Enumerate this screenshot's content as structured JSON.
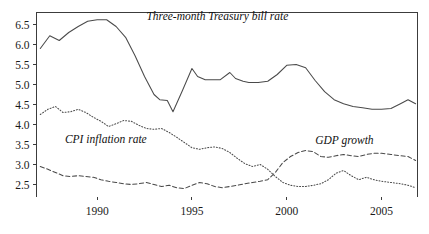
{
  "chart_data": {
    "type": "line",
    "title": "",
    "xlabel": "",
    "ylabel": "",
    "xlim": [
      1986.8,
      2006.9
    ],
    "ylim": [
      2.2,
      6.8
    ],
    "grid": false,
    "legend_position": "inline-annotations",
    "yticks": [
      "2.5",
      "3.0",
      "3.5",
      "4.0",
      "4.5",
      "5.0",
      "5.5",
      "6.0",
      "6.5"
    ],
    "ytick_values": [
      2.5,
      3.0,
      3.5,
      4.0,
      4.5,
      5.0,
      5.5,
      6.0,
      6.5
    ],
    "xticks": [
      "1990",
      "1995",
      "2000",
      "2005"
    ],
    "xtick_values": [
      1990,
      1995,
      2000,
      2005
    ],
    "series": [
      {
        "name": "Three-month Treasury bill rate",
        "style": "solid",
        "label_x": 1992.6,
        "label_y": 6.62,
        "x": [
          1987.0,
          1987.5,
          1988.0,
          1988.5,
          1989.0,
          1989.5,
          1990.0,
          1990.5,
          1991.0,
          1991.5,
          1992.0,
          1992.5,
          1993.0,
          1993.3,
          1993.7,
          1994.0,
          1994.5,
          1995.0,
          1995.3,
          1995.7,
          1996.0,
          1996.5,
          1997.0,
          1997.3,
          1997.7,
          1998.0,
          1998.5,
          1999.0,
          1999.5,
          2000.0,
          2000.5,
          2001.0,
          2001.5,
          2002.0,
          2002.5,
          2003.0,
          2003.5,
          2004.0,
          2004.5,
          2005.0,
          2005.5,
          2006.0,
          2006.4,
          2006.8
        ],
        "y": [
          5.9,
          6.22,
          6.1,
          6.3,
          6.45,
          6.58,
          6.62,
          6.62,
          6.45,
          6.18,
          5.72,
          5.2,
          4.75,
          4.62,
          4.6,
          4.32,
          4.85,
          5.4,
          5.2,
          5.12,
          5.12,
          5.12,
          5.3,
          5.15,
          5.08,
          5.05,
          5.05,
          5.08,
          5.25,
          5.48,
          5.5,
          5.42,
          5.1,
          4.82,
          4.62,
          4.52,
          4.45,
          4.42,
          4.38,
          4.38,
          4.4,
          4.52,
          4.62,
          4.52
        ]
      },
      {
        "name": "CPI inflation rate",
        "style": "dotted",
        "label_x": 1988.3,
        "label_y": 3.55,
        "x": [
          1987.0,
          1987.4,
          1987.8,
          1988.2,
          1988.6,
          1989.0,
          1989.4,
          1989.8,
          1990.2,
          1990.6,
          1991.0,
          1991.4,
          1991.8,
          1992.2,
          1992.6,
          1993.0,
          1993.4,
          1993.8,
          1994.2,
          1994.6,
          1995.0,
          1995.4,
          1995.8,
          1996.2,
          1996.6,
          1997.0,
          1997.4,
          1997.8,
          1998.2,
          1998.6,
          1999.0,
          1999.4,
          1999.8,
          2000.2,
          2000.6,
          2001.0,
          2001.4,
          2001.8,
          2002.2,
          2002.6,
          2003.0,
          2003.4,
          2003.8,
          2004.2,
          2004.6,
          2005.0,
          2005.5,
          2006.0,
          2006.4,
          2006.8
        ],
        "y": [
          4.25,
          4.38,
          4.45,
          4.3,
          4.32,
          4.38,
          4.3,
          4.18,
          4.08,
          3.95,
          4.02,
          4.1,
          4.08,
          3.98,
          3.9,
          3.88,
          3.9,
          3.8,
          3.68,
          3.55,
          3.42,
          3.38,
          3.42,
          3.44,
          3.4,
          3.3,
          3.15,
          3.02,
          2.95,
          3.0,
          2.88,
          2.7,
          2.55,
          2.48,
          2.45,
          2.45,
          2.48,
          2.52,
          2.62,
          2.78,
          2.85,
          2.72,
          2.62,
          2.68,
          2.62,
          2.58,
          2.55,
          2.52,
          2.48,
          2.42
        ]
      },
      {
        "name": "GDP growth",
        "style": "dashed",
        "label_x": 2001.5,
        "label_y": 3.52,
        "x": [
          1987.0,
          1987.4,
          1987.8,
          1988.2,
          1988.6,
          1989.0,
          1989.4,
          1989.8,
          1990.2,
          1990.6,
          1991.0,
          1991.4,
          1991.8,
          1992.2,
          1992.6,
          1993.0,
          1993.4,
          1993.8,
          1994.2,
          1994.6,
          1995.0,
          1995.4,
          1995.8,
          1996.2,
          1996.6,
          1997.0,
          1997.4,
          1997.8,
          1998.2,
          1998.6,
          1999.0,
          1999.4,
          1999.8,
          2000.2,
          2000.6,
          2001.0,
          2001.4,
          2001.8,
          2002.2,
          2002.6,
          2003.0,
          2003.4,
          2003.8,
          2004.2,
          2004.6,
          2005.0,
          2005.5,
          2006.0,
          2006.4,
          2006.8
        ],
        "y": [
          2.95,
          2.88,
          2.8,
          2.72,
          2.7,
          2.72,
          2.7,
          2.68,
          2.62,
          2.58,
          2.55,
          2.52,
          2.5,
          2.52,
          2.55,
          2.5,
          2.45,
          2.48,
          2.42,
          2.4,
          2.48,
          2.55,
          2.52,
          2.45,
          2.42,
          2.45,
          2.48,
          2.52,
          2.55,
          2.58,
          2.62,
          2.8,
          3.05,
          3.2,
          3.3,
          3.35,
          3.32,
          3.2,
          3.18,
          3.22,
          3.25,
          3.22,
          3.2,
          3.25,
          3.28,
          3.28,
          3.25,
          3.22,
          3.2,
          3.1
        ]
      }
    ]
  }
}
